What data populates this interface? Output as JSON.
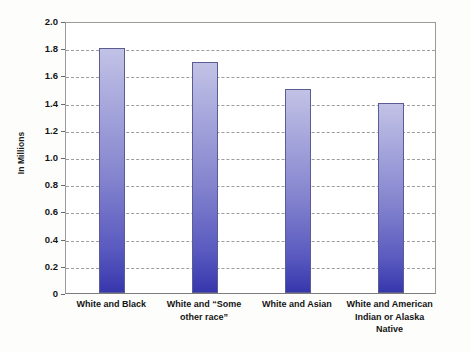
{
  "chart_data": {
    "type": "bar",
    "title": "",
    "subtitle": "",
    "xlabel": "",
    "ylabel": "In Millions",
    "categories": [
      "White and Black",
      "White and “Some other race”",
      "White and Asian",
      "White and American Indian or Alaska Native"
    ],
    "category_lines": [
      [
        "White and Black"
      ],
      [
        "White and “Some",
        "other race”"
      ],
      [
        "White and Asian"
      ],
      [
        "White and American",
        "Indian or Alaska",
        "Native"
      ]
    ],
    "values": [
      1.8,
      1.7,
      1.5,
      1.4
    ],
    "ylim": [
      0,
      2.0
    ],
    "ytick_values": [
      2.0,
      1.8,
      1.6,
      1.4,
      1.2,
      1.0,
      0.8,
      0.6,
      0.4,
      0.2,
      0
    ],
    "ytick_labels": [
      "2.0",
      "1.8",
      "1.6",
      "1.4",
      "1.2",
      "1.0",
      "0.8",
      "0.6",
      "0.4",
      "0.2",
      "0"
    ],
    "grid": true,
    "grid_style": "dashed",
    "legend": "none",
    "bar_color_top": "#c2c2e6",
    "bar_color_bottom": "#3737ad",
    "bar_border_color": "#5c5c94",
    "plot_border_color": "#9a9a9a",
    "gridline_color": "#9d9d9d",
    "background_color": "#fdfdfc"
  }
}
